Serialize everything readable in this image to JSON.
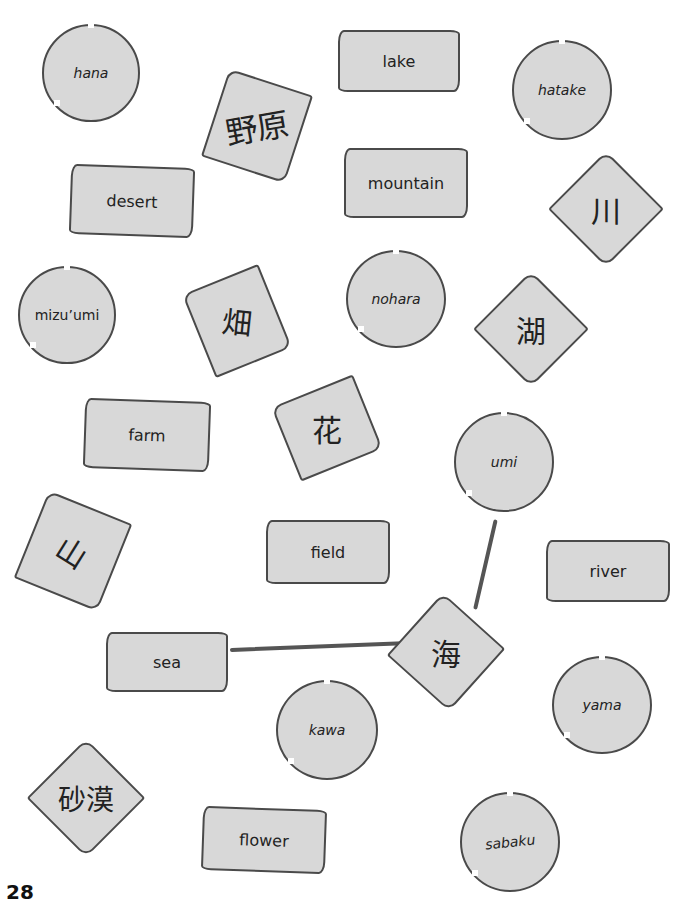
{
  "page": {
    "page_number": "28",
    "card_fill": "#d8d8d8",
    "outline_color": "#4a4a4a"
  },
  "cards": {
    "hana": "hana",
    "lake": "lake",
    "hatake": "hatake",
    "nohara_kanji": "野原",
    "desert": "desert",
    "mountain": "mountain",
    "kawa_kanji": "川",
    "mizuumi": "mizu’umi",
    "hatake_kanji": "畑",
    "nohara": "nohara",
    "mizuumi_kanji": "湖",
    "farm": "farm",
    "hana_kanji": "花",
    "umi": "umi",
    "yama_kanji": "山",
    "field": "field",
    "river": "river",
    "sea": "sea",
    "umi_kanji": "海",
    "kawa": "kawa",
    "yama": "yama",
    "sabaku_kanji": "砂漠",
    "flower": "flower",
    "sabaku": "sabaku"
  },
  "connections": [
    {
      "from": "sea",
      "to": "海"
    },
    {
      "from": "海",
      "to": "umi"
    }
  ]
}
